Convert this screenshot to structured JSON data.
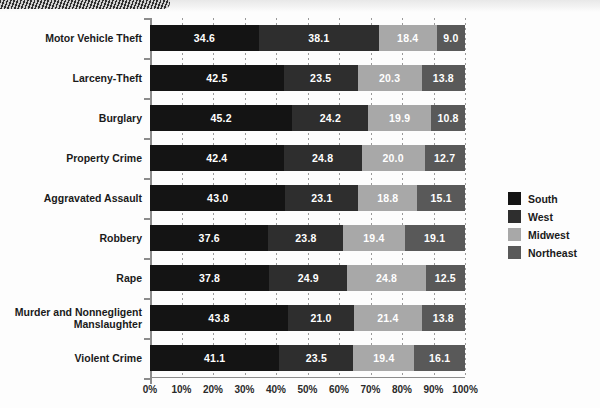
{
  "chart_data": {
    "type": "bar",
    "orientation": "horizontal",
    "stacked": true,
    "stack_mode": "percent",
    "title": "",
    "xlabel": "",
    "ylabel": "",
    "xlim": [
      0,
      100
    ],
    "xtick_labels": [
      "0%",
      "10%",
      "20%",
      "30%",
      "40%",
      "50%",
      "60%",
      "70%",
      "80%",
      "90%",
      "100%"
    ],
    "xticks": [
      0,
      10,
      20,
      30,
      40,
      50,
      60,
      70,
      80,
      90,
      100
    ],
    "grid": true,
    "legend_position": "right",
    "categories": [
      "Motor Vehicle Theft",
      "Larceny-Theft",
      "Burglary",
      "Property Crime",
      "Aggravated Assault",
      "Robbery",
      "Rape",
      "Murder and Nonnegligent Manslaughter",
      "Violent Crime"
    ],
    "series": [
      {
        "name": "South",
        "color": "#141414",
        "values": [
          34.6,
          42.5,
          45.2,
          42.4,
          43.0,
          37.6,
          37.8,
          43.8,
          41.1
        ]
      },
      {
        "name": "West",
        "color": "#2e2e2e",
        "values": [
          38.1,
          23.5,
          24.2,
          24.8,
          23.1,
          23.8,
          24.9,
          21.0,
          23.5
        ]
      },
      {
        "name": "Midwest",
        "color": "#a8a8a8",
        "values": [
          18.4,
          20.3,
          19.9,
          20.0,
          18.8,
          19.4,
          24.8,
          21.4,
          19.4
        ]
      },
      {
        "name": "Northeast",
        "color": "#595959",
        "values": [
          9.0,
          13.8,
          10.8,
          12.7,
          15.1,
          19.1,
          12.5,
          13.8,
          16.1
        ]
      }
    ]
  },
  "legend": {
    "items": [
      {
        "label": "South",
        "color": "#141414"
      },
      {
        "label": "West",
        "color": "#2e2e2e"
      },
      {
        "label": "Midwest",
        "color": "#a8a8a8"
      },
      {
        "label": "Northeast",
        "color": "#595959"
      }
    ]
  }
}
